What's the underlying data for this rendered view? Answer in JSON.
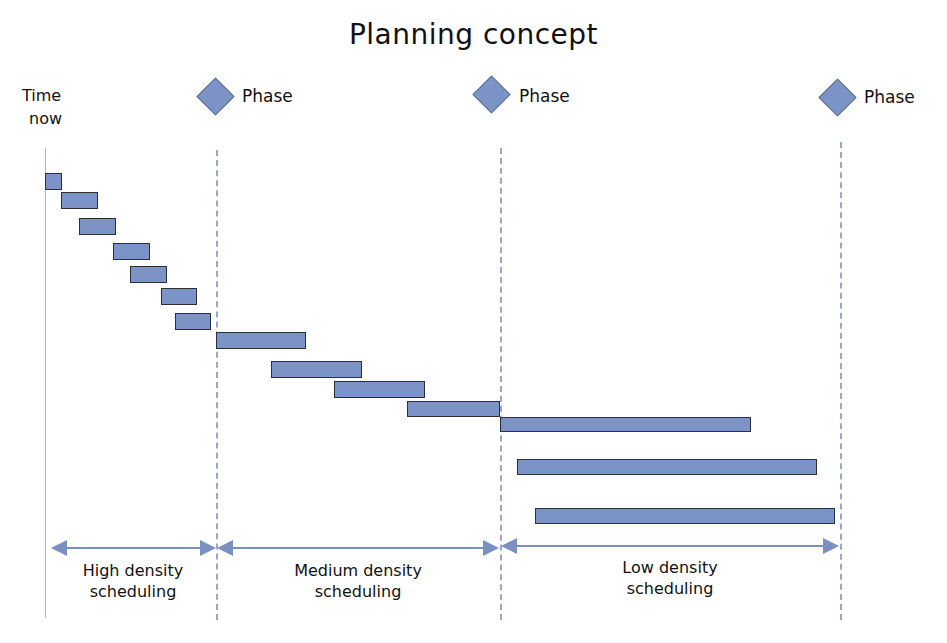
{
  "title": "Planning concept",
  "time_now": {
    "line1": "Time",
    "line2": "now"
  },
  "phases": [
    {
      "label": "Phase",
      "x": 216
    },
    {
      "label": "Phase",
      "x": 492
    },
    {
      "label": "Phase",
      "x": 838
    }
  ],
  "scopes": [
    {
      "line1": "High density",
      "line2": "scheduling"
    },
    {
      "line1": "Medium density",
      "line2": "scheduling"
    },
    {
      "line1": "Low density",
      "line2": "scheduling"
    }
  ],
  "colors": {
    "bar": "#7b93c6",
    "bar_border": "#2b2f3a",
    "guide": "#98a8cc"
  },
  "tasks": [
    {
      "x": 45,
      "y": 173,
      "w": 17,
      "h": 17
    },
    {
      "x": 61,
      "y": 192,
      "w": 37,
      "h": 17
    },
    {
      "x": 79,
      "y": 218,
      "w": 37,
      "h": 17
    },
    {
      "x": 113,
      "y": 243,
      "w": 37,
      "h": 17
    },
    {
      "x": 130,
      "y": 266,
      "w": 37,
      "h": 17
    },
    {
      "x": 161,
      "y": 288,
      "w": 36,
      "h": 17
    },
    {
      "x": 175,
      "y": 313,
      "w": 36,
      "h": 17
    },
    {
      "x": 216,
      "y": 332,
      "w": 90,
      "h": 17
    },
    {
      "x": 271,
      "y": 361,
      "w": 91,
      "h": 17
    },
    {
      "x": 334,
      "y": 381,
      "w": 91,
      "h": 17
    },
    {
      "x": 407,
      "y": 401,
      "w": 93,
      "h": 16
    },
    {
      "x": 500,
      "y": 417,
      "w": 251,
      "h": 15
    },
    {
      "x": 517,
      "y": 459,
      "w": 300,
      "h": 16
    },
    {
      "x": 535,
      "y": 508,
      "w": 300,
      "h": 16
    }
  ]
}
